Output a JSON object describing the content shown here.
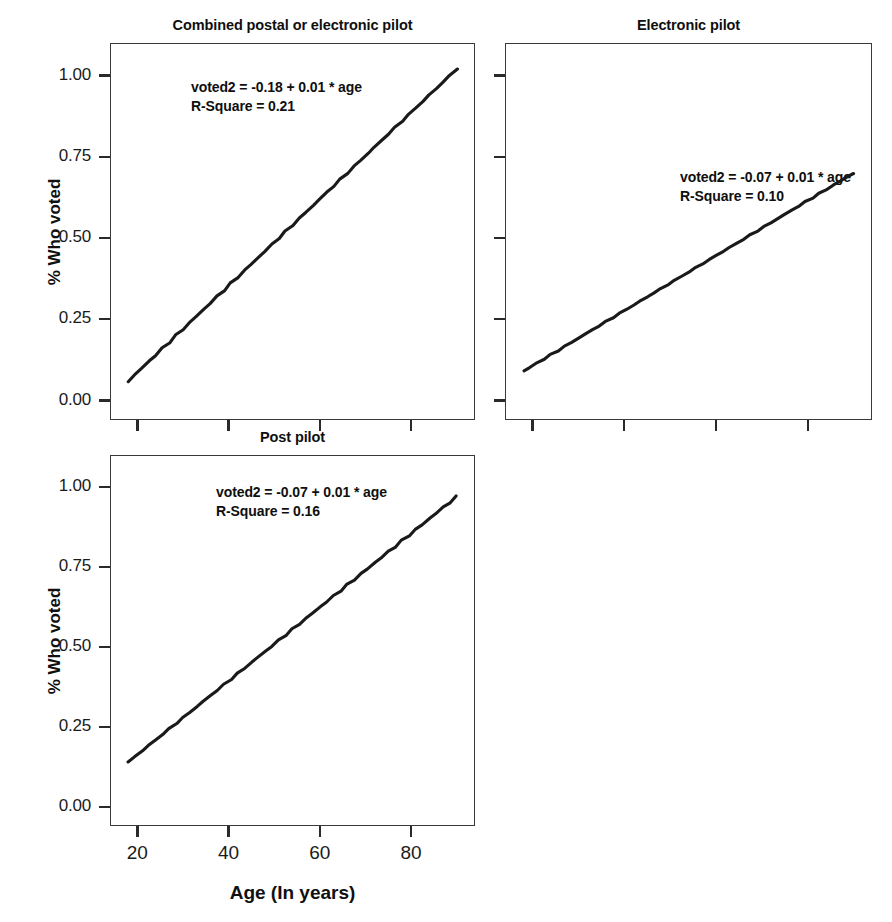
{
  "figure": {
    "width": 892,
    "height": 922,
    "background": "#ffffff",
    "line_color": "#1a1a1a",
    "axis_color": "#3a3a3a"
  },
  "axes": {
    "y_title": "% Who voted",
    "x_title": "Age (In years)",
    "y_ticks": [
      "0.00",
      "0.25",
      "0.50",
      "0.75",
      "1.00"
    ],
    "y_tick_values": [
      0.0,
      0.25,
      0.5,
      0.75,
      1.0
    ],
    "x_ticks": [
      "20",
      "40",
      "60",
      "80"
    ],
    "x_tick_values": [
      20,
      40,
      60,
      80
    ],
    "ylim": [
      -0.06,
      1.1
    ],
    "xlim": [
      14,
      94
    ]
  },
  "panels": [
    {
      "id": "combined-postal-or-electronic-pilot",
      "title": "Combined postal or electronic pilot",
      "equation": "voted2 = -0.18 + 0.01 * age",
      "r_square": "R-Square = 0.21",
      "r_square_value": 0.21,
      "intercept": -0.18,
      "slope": 0.01,
      "line": {
        "x0": 18,
        "y0": 0.06,
        "x1": 90,
        "y1": 1.02
      },
      "box": {
        "left": 110,
        "top": 43,
        "width": 365,
        "height": 377
      },
      "annotation": {
        "left": 191,
        "top": 78
      },
      "show_y_axis": true,
      "show_y_tick_labels": true,
      "show_x_tick_labels": false
    },
    {
      "id": "electronic-pilot",
      "title": "Electronic pilot",
      "equation": "voted2 = -0.07 + 0.01 * age",
      "r_square": "R-Square = 0.10",
      "r_square_value": 0.1,
      "intercept": -0.07,
      "slope": 0.01,
      "line": {
        "x0": 18,
        "y0": 0.09,
        "x1": 90,
        "y1": 0.7
      },
      "box": {
        "left": 505,
        "top": 43,
        "width": 367,
        "height": 377
      },
      "annotation": {
        "left": 680,
        "top": 168
      },
      "show_y_axis": true,
      "show_y_tick_labels": false,
      "show_x_tick_labels": false
    },
    {
      "id": "post-pilot",
      "title": "Post pilot",
      "equation": "voted2 = -0.07 + 0.01 * age",
      "r_square": "R-Square = 0.16",
      "r_square_value": 0.16,
      "intercept": -0.07,
      "slope": 0.01,
      "line": {
        "x0": 18,
        "y0": 0.14,
        "x1": 90,
        "y1": 0.97
      },
      "box": {
        "left": 110,
        "top": 455,
        "width": 365,
        "height": 371
      },
      "annotation": {
        "left": 216,
        "top": 483
      },
      "show_y_axis": true,
      "show_y_tick_labels": true,
      "show_x_tick_labels": true
    }
  ],
  "chart_data": {
    "type": "line",
    "title": "",
    "subplots": [
      {
        "title": "Combined postal or electronic pilot",
        "series": [
          {
            "name": "fitted regression line",
            "x": [
              18,
              90
            ],
            "values": [
              0.06,
              1.02
            ]
          }
        ],
        "annotations": [
          "voted2 = -0.18 + 0.01 * age",
          "R-Square = 0.21"
        ],
        "xlabel": "Age (In years)",
        "ylabel": "% Who voted",
        "xlim": [
          14,
          94
        ],
        "ylim": [
          -0.06,
          1.1
        ],
        "xticks": [
          20,
          40,
          60,
          80
        ],
        "yticks": [
          0.0,
          0.25,
          0.5,
          0.75,
          1.0
        ],
        "grid": false
      },
      {
        "title": "Electronic pilot",
        "series": [
          {
            "name": "fitted regression line",
            "x": [
              18,
              90
            ],
            "values": [
              0.09,
              0.7
            ]
          }
        ],
        "annotations": [
          "voted2 = -0.07 + 0.01 * age",
          "R-Square = 0.10"
        ],
        "xlabel": "Age (In years)",
        "ylabel": "% Who voted",
        "xlim": [
          14,
          94
        ],
        "ylim": [
          -0.06,
          1.1
        ],
        "xticks": [
          20,
          40,
          60,
          80
        ],
        "yticks": [
          0.0,
          0.25,
          0.5,
          0.75,
          1.0
        ],
        "grid": false
      },
      {
        "title": "Post pilot",
        "series": [
          {
            "name": "fitted regression line",
            "x": [
              18,
              90
            ],
            "values": [
              0.14,
              0.97
            ]
          }
        ],
        "annotations": [
          "voted2 = -0.07 + 0.01 * age",
          "R-Square = 0.16"
        ],
        "xlabel": "Age (In years)",
        "ylabel": "% Who voted",
        "xlim": [
          14,
          94
        ],
        "ylim": [
          -0.06,
          1.1
        ],
        "xticks": [
          20,
          40,
          60,
          80
        ],
        "yticks": [
          0.0,
          0.25,
          0.5,
          0.75,
          1.0
        ],
        "grid": false
      }
    ],
    "legend": null,
    "legend_position": "none"
  }
}
